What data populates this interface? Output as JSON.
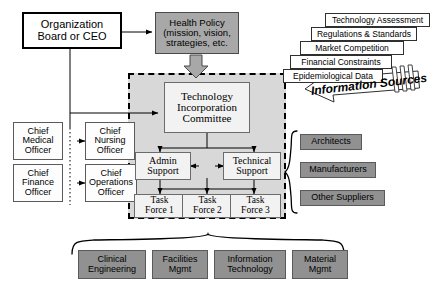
{
  "diagram": {
    "colors": {
      "gray_fill": "#919191",
      "region_fill": "#d8d8d8",
      "box_fill": "#fdfdfd",
      "line": "#000000"
    }
  },
  "top": {
    "org_board": "Organization\nBoard or CEO",
    "org_board_line1": "Organization",
    "org_board_line2": "Board or CEO",
    "health_policy_line1": "Health Policy",
    "health_policy_line2": "(mission, vision,",
    "health_policy_line3": "strategies, etc."
  },
  "executives": [
    {
      "id": "cmo",
      "line1": "Chief",
      "line2": "Medical",
      "line3": "Officer"
    },
    {
      "id": "cno",
      "line1": "Chief",
      "line2": "Nursing",
      "line3": "Officer"
    },
    {
      "id": "cfo",
      "line1": "Chief",
      "line2": "Finance",
      "line3": "Officer"
    },
    {
      "id": "coo",
      "line1": "Chief",
      "line2": "Operations",
      "line3": "Officer"
    }
  ],
  "committee": {
    "line1": "Technology",
    "line2": "Incorporation",
    "line3": "Committee",
    "supports": [
      {
        "id": "admin",
        "line1": "Admin",
        "line2": "Support"
      },
      {
        "id": "technical",
        "line1": "Technical",
        "line2": "Support"
      }
    ],
    "task_forces": [
      {
        "id": "tf1",
        "line1": "Task",
        "line2": "Force 1"
      },
      {
        "id": "tf2",
        "line1": "Task",
        "line2": "Force 2"
      },
      {
        "id": "tf3",
        "line1": "Task",
        "line2": "Force 3"
      }
    ]
  },
  "information_sources": {
    "banner_label": "Information Sources",
    "items": [
      "Technology Assessment",
      "Regulations & Standards",
      "Market Competition",
      "Financial Constraints",
      "Epidemiological Data"
    ]
  },
  "external_partners": [
    "Architects",
    "Manufacturers",
    "Other Suppliers"
  ],
  "departments": [
    {
      "line1": "Clinical",
      "line2": "Engineering"
    },
    {
      "line1": "Facilities",
      "line2": "Mgmt"
    },
    {
      "line1": "Information",
      "line2": "Technology"
    },
    {
      "line1": "Material",
      "line2": "Mgmt"
    }
  ]
}
